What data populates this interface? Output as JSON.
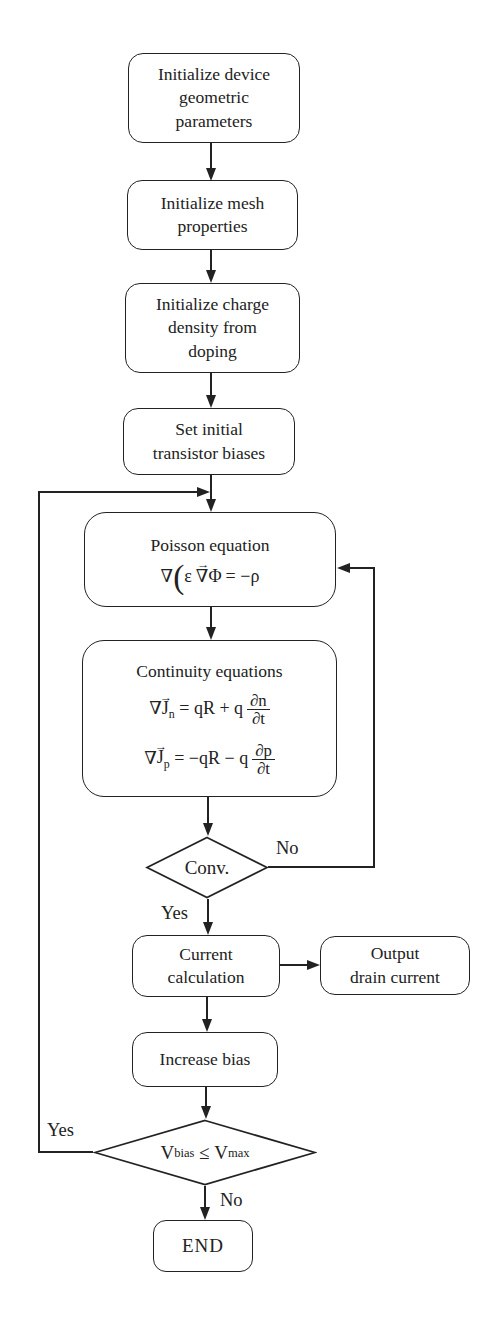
{
  "nodes": {
    "init_device": {
      "label": "Initialize device\ngeometric\nparameters"
    },
    "init_mesh": {
      "label": "Initialize mesh\nproperties"
    },
    "init_charge": {
      "label": "Initialize charge\ndensity from\ndoping"
    },
    "set_bias": {
      "label": "Set initial\ntransistor biases"
    },
    "poisson": {
      "title": "Poisson equation",
      "formula": {
        "nabla": "∇",
        "lparen": "(",
        "epsilon": "ε",
        "vec_arrow": "→",
        "nabla_vec": "∇",
        "phi": "Φ",
        "equals": "=",
        "rhs": "−ρ"
      }
    },
    "continuity": {
      "title": "Continuity equations",
      "eq_n": {
        "nabla": "∇",
        "j": "J",
        "vec_arrow": "→",
        "sub": "n",
        "mid": "= qR + q",
        "num": "∂n",
        "den": "∂t"
      },
      "eq_p": {
        "nabla": "∇",
        "j": "J",
        "vec_arrow": "→",
        "sub": "p",
        "mid": "= −qR − q",
        "num": "∂p",
        "den": "∂t"
      }
    },
    "conv": {
      "label": "Conv."
    },
    "current_calc": {
      "label": "Current\ncalculation"
    },
    "output_drain": {
      "label": "Output\ndrain current"
    },
    "increase_bias": {
      "label": "Increase bias"
    },
    "vbias_check": {
      "v1": "V",
      "sub1": "bias",
      "op": "≤",
      "v2": "V",
      "sub2": "max"
    },
    "end": {
      "label": "END"
    }
  },
  "edge_labels": {
    "conv_no": "No",
    "conv_yes": "Yes",
    "vbias_yes": "Yes",
    "vbias_no": "No"
  },
  "colors": {
    "ink": "#222222",
    "background": "#ffffff"
  }
}
